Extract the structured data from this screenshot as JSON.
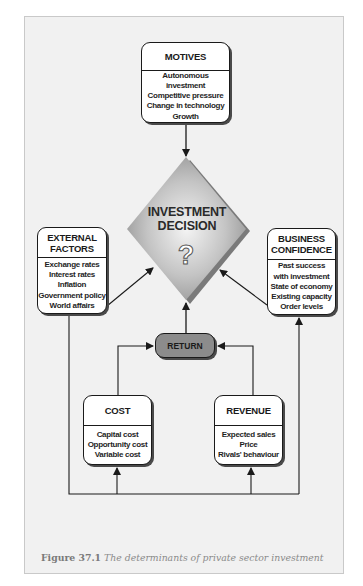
{
  "figure": {
    "caption_label": "Figure 37.1",
    "caption_text": "The determinants of private sector investment"
  },
  "nodes": {
    "motives": {
      "title": "MOTIVES",
      "items": [
        "Autonomous investment",
        "Competitive pressure",
        "Change in technology",
        "Growth"
      ]
    },
    "decision": {
      "line1": "INVESTMENT",
      "line2": "DECISION",
      "symbol": "?"
    },
    "external_factors": {
      "title_line1": "EXTERNAL",
      "title_line2": "FACTORS",
      "items": [
        "Exchange rates",
        "Interest rates",
        "Inflation",
        "Government policy",
        "World affairs"
      ]
    },
    "business_confidence": {
      "title_line1": "BUSINESS",
      "title_line2": "CONFIDENCE",
      "items": [
        "Past success",
        "with investment",
        "State of economy",
        "Existing capacity",
        "Order levels"
      ]
    },
    "return": {
      "title": "RETURN"
    },
    "cost": {
      "title": "COST",
      "items": [
        "Capital cost",
        "Opportunity cost",
        "Variable cost"
      ]
    },
    "revenue": {
      "title": "REVENUE",
      "items": [
        "Expected sales",
        "Price",
        "Rivals' behaviour"
      ]
    }
  },
  "edges": [
    {
      "from": "MOTIVES",
      "to": "INVESTMENT DECISION"
    },
    {
      "from": "EXTERNAL FACTORS",
      "to": "INVESTMENT DECISION"
    },
    {
      "from": "BUSINESS CONFIDENCE",
      "to": "INVESTMENT DECISION"
    },
    {
      "from": "RETURN",
      "to": "INVESTMENT DECISION"
    },
    {
      "from": "COST",
      "to": "RETURN"
    },
    {
      "from": "REVENUE",
      "to": "RETURN"
    },
    {
      "from": "EXTERNAL FACTORS",
      "to": "COST"
    },
    {
      "from": "EXTERNAL FACTORS",
      "to": "REVENUE"
    },
    {
      "from": "EXTERNAL FACTORS",
      "to": "BUSINESS CONFIDENCE"
    }
  ],
  "colors": {
    "frame_bg": "#f1f1f1",
    "box_bg": "#ffffff",
    "return_bg": "#8c8c8c",
    "diamond_light": "#eeeeee",
    "diamond_dark": "#8f8f8f",
    "line": "#1a1a1a"
  }
}
